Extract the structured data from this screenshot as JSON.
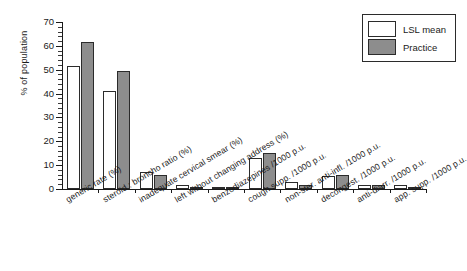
{
  "chart_data": {
    "type": "bar",
    "title": "",
    "xlabel": "",
    "ylabel": "% of population",
    "ylim": [
      0,
      70
    ],
    "ytick_step": 10,
    "yminor_step": 2,
    "grid": false,
    "legend_position": "top-right",
    "categories": [
      "generic rate (%)",
      "steroid : broncho ratio (%)",
      "inadequate cervical smear (%)",
      "left without changing address (%)",
      "benzodiazepines /1000 p.u.",
      "cough supp. /1000 p.u.",
      "non-ster. anti-infl. /1000 p.u.",
      "decongest. /1000 p.u.",
      "anti-diarr. /1000 p.u.",
      "app. supp. /1000 p.u."
    ],
    "series": [
      {
        "name": "LSL mean",
        "color": "#ffffff",
        "values": [
          51.5,
          41,
          7,
          1.5,
          0.5,
          13,
          3,
          5.5,
          1.5,
          1.5
        ]
      },
      {
        "name": "Practice",
        "color": "#8d8d8d",
        "values": [
          61.5,
          49.5,
          6,
          1,
          0.4,
          15,
          1.5,
          6,
          1.5,
          1
        ]
      }
    ],
    "ytick_labels": [
      "0",
      "10",
      "20",
      "30",
      "40",
      "50",
      "60",
      "70"
    ]
  },
  "legend": {
    "entries": [
      {
        "label": "LSL mean",
        "swatch": "lsl"
      },
      {
        "label": "Practice",
        "swatch": "prac"
      }
    ]
  }
}
